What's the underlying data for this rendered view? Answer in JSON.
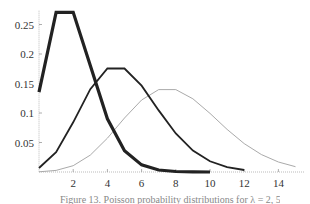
{
  "chart_data": {
    "type": "line",
    "title": "",
    "xlabel": "",
    "ylabel": "",
    "xlim": [
      0,
      15.5
    ],
    "ylim": [
      0,
      0.27
    ],
    "grid": false,
    "legend": "none",
    "x_ticks": [
      2,
      4,
      6,
      8,
      10,
      12,
      14
    ],
    "x_tick_labels": [
      "2",
      "4",
      "6",
      "8",
      "10",
      "12",
      "14"
    ],
    "y_ticks": [
      0.05,
      0.1,
      0.15,
      0.2,
      0.25
    ],
    "y_tick_labels": [
      "0.05",
      "0.1",
      "0.15",
      "0.2",
      "0.25"
    ],
    "series": [
      {
        "name": "lambda=2",
        "style": "thick",
        "color": "#222222",
        "width": 3.2,
        "x": [
          0,
          1,
          2,
          3,
          4,
          5,
          6,
          7,
          8,
          9,
          10
        ],
        "values": [
          0.1353,
          0.2707,
          0.2707,
          0.1804,
          0.0902,
          0.0361,
          0.012,
          0.0034,
          0.0009,
          0.0002,
          4e-05
        ]
      },
      {
        "name": "lambda=5",
        "style": "medium",
        "color": "#222222",
        "width": 1.8,
        "x": [
          0,
          1,
          2,
          3,
          4,
          5,
          6,
          7,
          8,
          9,
          10,
          11,
          12
        ],
        "values": [
          0.0067,
          0.0337,
          0.0842,
          0.1404,
          0.1755,
          0.1755,
          0.1462,
          0.1044,
          0.0653,
          0.0363,
          0.0181,
          0.0082,
          0.0034
        ]
      },
      {
        "name": "lambda=8",
        "style": "thin",
        "color": "#aaaaaa",
        "width": 1.0,
        "x": [
          0,
          1,
          2,
          3,
          4,
          5,
          6,
          7,
          8,
          9,
          10,
          11,
          12,
          13,
          14,
          15
        ],
        "values": [
          0.0003,
          0.0027,
          0.0107,
          0.0286,
          0.0573,
          0.0916,
          0.1221,
          0.1396,
          0.1396,
          0.1241,
          0.0993,
          0.0722,
          0.0481,
          0.0296,
          0.0169,
          0.009
        ]
      }
    ]
  },
  "caption": "Figure 13. Poisson probability distributions for λ = 2, 5, and 8"
}
